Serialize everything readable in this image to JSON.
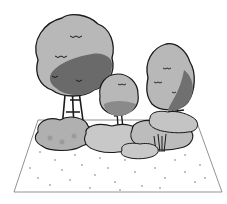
{
  "image": {
    "description": "Grayscale clip-art illustration of trees and shrubs on a rectangular patch of speckled ground",
    "top_text_cropped": "",
    "elements": [
      {
        "type": "tree",
        "name": "large-round-tree",
        "position": "left"
      },
      {
        "type": "tree",
        "name": "small-round-tree",
        "position": "center"
      },
      {
        "type": "tree",
        "name": "tall-tree",
        "position": "right"
      },
      {
        "type": "shrub",
        "name": "shrub-cluster",
        "count": 6
      },
      {
        "type": "ground",
        "name": "speckled-ground-plot"
      }
    ],
    "colors": {
      "outline": "#1a1a1a",
      "light_foliage": "#b8b8b8",
      "mid_foliage": "#9a9a9a",
      "dark_foliage": "#6a6a6a",
      "shrub": "#c4c4c4",
      "ground": "#ffffff"
    }
  }
}
